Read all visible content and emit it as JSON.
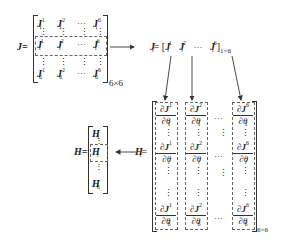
{
  "diagram": {
    "j_matrix": {
      "label": "J=",
      "size": "6×6",
      "rows": [
        {
          "cells": [
            "J",
            "J",
            "···",
            "J"
          ],
          "row_sub": "1",
          "col_sups": [
            "1",
            "2",
            "",
            "6"
          ]
        },
        {
          "cells": [
            "J",
            "J",
            "···",
            "J"
          ],
          "row_sub": "i",
          "col_sups": [
            "1",
            "2",
            "",
            "6"
          ],
          "highlighted": true
        },
        {
          "cells": [
            "J",
            "J",
            "···",
            "J"
          ],
          "row_sub": "6",
          "col_sups": [
            "1",
            "2",
            "",
            "6"
          ]
        }
      ],
      "vertical_dots": "⋮"
    },
    "ji_row": {
      "label": "J",
      "label_sub": "i",
      "equals": "=",
      "open_bracket": "[",
      "close_bracket": "]",
      "cells": [
        {
          "base": "J",
          "sup": "1",
          "sub": "i"
        },
        {
          "base": "J",
          "sup": "2",
          "sub": "i"
        },
        {
          "base": "···"
        },
        {
          "base": "J",
          "sup": "6",
          "sub": "i"
        }
      ],
      "size": "1×6"
    },
    "hi_matrix": {
      "label": "H",
      "label_sub": "i",
      "equals": "=",
      "size": "6×6",
      "partial": "∂",
      "theta": "θ",
      "columns": [
        {
          "sup": "1",
          "entries": [
            {
              "den_sub": "1"
            },
            {
              "den_sub": "i"
            },
            {
              "den_sub": "6"
            }
          ]
        },
        {
          "sup": "2",
          "entries": [
            {
              "den_sub": "1"
            },
            {
              "den_sub": "i"
            },
            {
              "den_sub": "6"
            }
          ]
        },
        {
          "sup": "6",
          "entries": [
            {
              "den_sub": "1"
            },
            {
              "den_sub": "i"
            },
            {
              "den_sub": "6"
            }
          ]
        }
      ],
      "hdots": "···",
      "vdots": "⋮"
    },
    "h_matrix": {
      "label": "H=",
      "entries": [
        {
          "base": "H",
          "sub": "1"
        },
        {
          "base": "H",
          "sub": "i",
          "highlighted": true
        },
        {
          "base": "H",
          "sub": "6"
        }
      ],
      "vdots": "⋮"
    },
    "arrows": [
      {
        "from": "j_matrix",
        "to": "ji_row",
        "direction": "right"
      },
      {
        "from": "ji_row.J1",
        "to": "hi_matrix.col1",
        "direction": "down"
      },
      {
        "from": "ji_row.J2",
        "to": "hi_matrix.col2",
        "direction": "down"
      },
      {
        "from": "ji_row.J6",
        "to": "hi_matrix.col6",
        "direction": "down"
      },
      {
        "from": "hi_matrix",
        "to": "h_matrix",
        "direction": "left"
      }
    ]
  }
}
